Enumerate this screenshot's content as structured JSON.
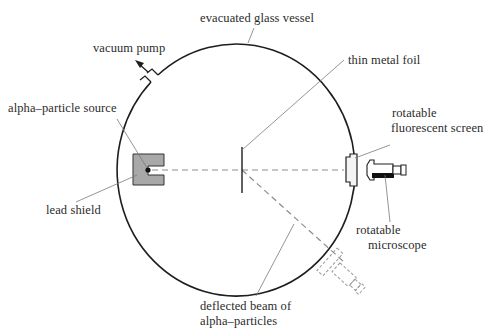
{
  "diagram": {
    "labels": {
      "vessel": "evacuated glass vessel",
      "pump": "vacuum pump",
      "foil": "thin metal foil",
      "source": "alpha–particle source",
      "screen_line1": "rotatable",
      "screen_line2": "fluorescent screen",
      "shield": "lead shield",
      "microscope_line1": "rotatable",
      "microscope_line2": "microscope",
      "beam_line1": "deflected beam of",
      "beam_line2": "alpha–particles"
    },
    "colors": {
      "outline": "#1e1e1e",
      "leader": "#7a7a7a",
      "shield_fill": "#a8a8a8",
      "beam_dash": "#8c8c8c",
      "ghost_dash": "#9a9a9a"
    }
  }
}
